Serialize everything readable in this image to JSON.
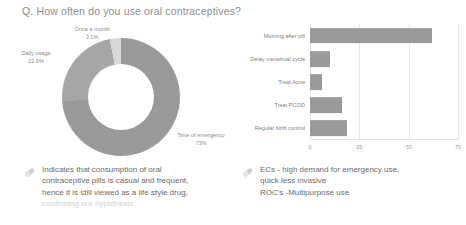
{
  "slide": {
    "title": "Q. How often do you use oral contraceptives?"
  },
  "colors": {
    "bar_fill": "#9a9a9a",
    "donut_major": "#9a9a9a",
    "donut_mid": "#a6a6a6",
    "donut_light": "#d8d8d8",
    "text": "#6b6b6b",
    "text_faded": "#d2d2d2",
    "gridline": "#e9e9e9"
  },
  "chart_data": [
    {
      "type": "pie",
      "title": "How often do you use oral contraceptives?",
      "labels": [
        "Time of emergency",
        "Daily usage",
        "Once a month"
      ],
      "values": [
        73,
        22.9,
        3.1
      ],
      "value_labels": [
        "73%",
        "22.9%",
        "3.1%"
      ],
      "colors": [
        "#9a9a9a",
        "#a6a6a6",
        "#d8d8d8"
      ],
      "donut": true,
      "legend": "callout-labels",
      "annotations": [
        {
          "label": "Once a month",
          "value": "3.1%"
        },
        {
          "label": "Daily usage",
          "value": "22.9%"
        },
        {
          "label": "Time of emergency",
          "value": "73%"
        }
      ]
    },
    {
      "type": "bar",
      "orientation": "horizontal",
      "title": "",
      "xlabel": "",
      "ylabel": "",
      "categories": [
        "Morning after pill",
        "Delay menstrual cycle",
        "Treat Acne",
        "Treat PCOD",
        "Regular birth control"
      ],
      "values": [
        62,
        10,
        6,
        16,
        19
      ],
      "xlim": [
        0,
        75
      ],
      "xticks": [
        "0",
        "25",
        "50",
        "75"
      ],
      "xtick_values": [
        0,
        25,
        50,
        75
      ],
      "grid": true,
      "legend": "none"
    }
  ],
  "notes": {
    "left": {
      "icon": "pill-capsule-icon",
      "lines": [
        "Indicates that consumption of oral",
        "contraceptive pills is casual and frequent,",
        "hence it is still viewed as a life style drug,"
      ],
      "faded_line": "confirming our hypothesis"
    },
    "right": {
      "icon": "pill-capsule-icon",
      "lines": [
        "ECs - high demand for emergency use,",
        "quick less invasive",
        "ROC's -Multipurpose use"
      ]
    }
  }
}
